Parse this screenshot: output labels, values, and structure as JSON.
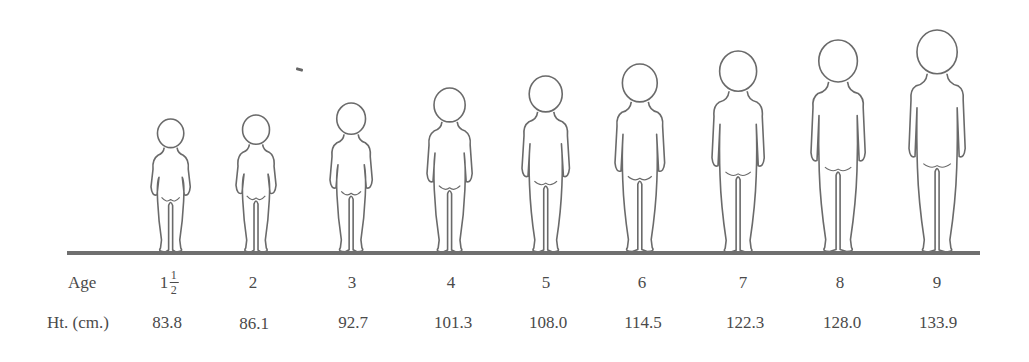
{
  "chart_data": {
    "type": "table",
    "title": "",
    "row_labels": {
      "age": "Age",
      "height": "Ht. (cm.)"
    },
    "categories": [
      "1½",
      "2",
      "3",
      "4",
      "5",
      "6",
      "7",
      "8",
      "9"
    ],
    "series": [
      {
        "name": "Ht. (cm.)",
        "values": [
          83.8,
          86.1,
          92.7,
          101.3,
          108.0,
          114.5,
          122.3,
          128.0,
          133.9
        ]
      }
    ],
    "xlabel": "Age",
    "ylabel": "Ht. (cm.)"
  },
  "labels": {
    "age_row": "Age",
    "height_row": "Ht. (cm.)"
  },
  "columns": [
    {
      "age_whole": "1",
      "age_num": "1",
      "age_den": "2",
      "height": "83.8"
    },
    {
      "age": "2",
      "height": "86.1"
    },
    {
      "age": "3",
      "height": "92.7"
    },
    {
      "age": "4",
      "height": "101.3"
    },
    {
      "age": "5",
      "height": "108.0"
    },
    {
      "age": "6",
      "height": "114.5"
    },
    {
      "age": "7",
      "height": "122.3"
    },
    {
      "age": "8",
      "height": "128.0"
    },
    {
      "age": "9",
      "height": "133.9"
    }
  ]
}
